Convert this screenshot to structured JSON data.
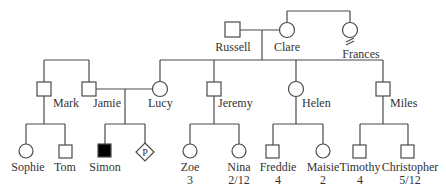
{
  "diagram": {
    "type": "pedigree",
    "line_color": "#4a4a4a",
    "affected_fill": "#000000",
    "generation_1": {
      "russell": {
        "name": "Russell",
        "sex": "male"
      },
      "clare": {
        "name": "Clare",
        "sex": "female"
      },
      "frances": {
        "name": "Frances",
        "sex": "female",
        "note": "relationship-break marker"
      }
    },
    "generation_2": {
      "mark": {
        "name": "Mark",
        "sex": "male"
      },
      "jamie": {
        "name": "Jamie",
        "sex": "male"
      },
      "lucy": {
        "name": "Lucy",
        "sex": "female"
      },
      "jeremy": {
        "name": "Jeremy",
        "sex": "male"
      },
      "helen": {
        "name": "Helen",
        "sex": "female"
      },
      "miles": {
        "name": "Miles",
        "sex": "male"
      }
    },
    "generation_3": {
      "sophie": {
        "name": "Sophie",
        "sex": "female"
      },
      "tom": {
        "name": "Tom",
        "sex": "male"
      },
      "simon": {
        "name": "Simon",
        "sex": "male",
        "affected": true
      },
      "pregnancy": {
        "name": "",
        "symbol_label": "P",
        "sex": "unknown"
      },
      "zoe": {
        "name": "Zoe",
        "age": "3",
        "sex": "female"
      },
      "nina": {
        "name": "Nina",
        "age": "2/12",
        "sex": "female"
      },
      "freddie": {
        "name": "Freddie",
        "age": "4",
        "sex": "male"
      },
      "maisie": {
        "name": "Maisie",
        "age": "2",
        "sex": "female"
      },
      "timothy": {
        "name": "Timothy",
        "age": "4",
        "sex": "male"
      },
      "christopher": {
        "name": "Christopher",
        "age": "5/12",
        "sex": "male"
      }
    }
  }
}
